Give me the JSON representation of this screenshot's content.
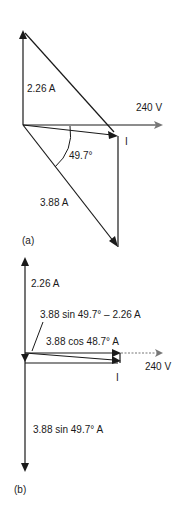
{
  "diagram": {
    "type": "phasor-diagram",
    "colors": {
      "line": "#1a1a1a",
      "reference": "#777777",
      "background": "#ffffff"
    },
    "panel_a": {
      "caption": "(a)",
      "labels": {
        "capacitive_current": "2.26 A",
        "voltage": "240 V",
        "resultant_current": "I",
        "angle": "49.7°",
        "inductive_current": "3.88 A"
      }
    },
    "panel_b": {
      "caption": "(b)",
      "labels": {
        "capacitive_current": "2.26 A",
        "net_reactive": "3.88 sin 49.7° – 2.26 A",
        "in_phase_component": "3.88 cos 48.7° A",
        "voltage": "240 V",
        "resultant_current": "I",
        "reactive_component": "3.88 sin 49.7° A"
      }
    }
  }
}
